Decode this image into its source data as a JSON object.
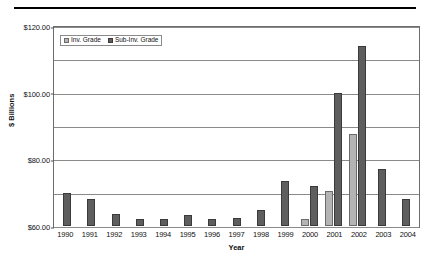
{
  "chart_data": {
    "type": "bar",
    "title": "",
    "xlabel": "Year",
    "ylabel": "$ Billions",
    "ylim": [
      0,
      120
    ],
    "ytick_values": [
      120,
      100,
      80,
      60,
      40,
      20,
      0
    ],
    "ytick_labels": [
      "$120.00",
      "$100.00",
      "$80.00",
      "$60.00",
      "$40.00",
      "$20.00",
      "$0.00"
    ],
    "grid": true,
    "legend_position": "upper-left-inside",
    "categories": [
      "1990",
      "1991",
      "1992",
      "1993",
      "1994",
      "1995",
      "1996",
      "1997",
      "1998",
      "1999",
      "2000",
      "2001",
      "2002",
      "2003",
      "2004"
    ],
    "series": [
      {
        "name": "Inv. Grade",
        "color": "#b4b4b4",
        "values": [
          0,
          0,
          0,
          0,
          0,
          0,
          0,
          0,
          0,
          0,
          4.5,
          21.0,
          55.0,
          0,
          0
        ]
      },
      {
        "name": "Sub-Inv. Grade",
        "color": "#5e5e5e",
        "values": [
          20.0,
          16.5,
          7.5,
          4.0,
          4.0,
          6.5,
          4.5,
          5.0,
          9.5,
          27.0,
          24.0,
          80.0,
          108.0,
          34.0,
          16.0
        ]
      }
    ]
  },
  "axes": {
    "y_axis_label": "$ Billions",
    "x_axis_label": "Year"
  },
  "legend": {
    "items": [
      {
        "label": "Inv. Grade",
        "swatch": "inv"
      },
      {
        "label": "Sub-Inv. Grade",
        "swatch": "sub"
      }
    ]
  },
  "colors": {
    "inv_grade": "#b4b4b4",
    "sub_inv_grade": "#5e5e5e",
    "grid": "#8a8a8a",
    "rule": "#000000"
  }
}
